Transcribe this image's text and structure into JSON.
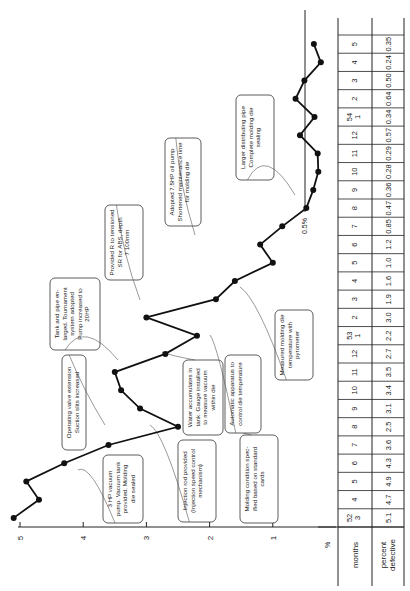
{
  "chart_data": {
    "type": "line",
    "orientation": "rotated-90-ccw",
    "title": "",
    "xlabel": "months",
    "ylabel": "%",
    "ylim": [
      0,
      5
    ],
    "y_ticks": [
      "5",
      "4",
      "3",
      "2",
      "1"
    ],
    "reference_line": {
      "value": 0.5,
      "label": "0.5%"
    },
    "table_row_labels": [
      "months",
      "percent defective"
    ],
    "categories": [
      "52/3",
      "4",
      "5",
      "6",
      "7",
      "8",
      "9",
      "10",
      "11",
      "12",
      "53/1",
      "2",
      "3",
      "4",
      "5",
      "6",
      "7",
      "8",
      "9",
      "10",
      "11",
      "12",
      "54/1",
      "2",
      "3",
      "4",
      "5"
    ],
    "month_labels": [
      {
        "year": "52",
        "month": "3"
      },
      {
        "month": "4"
      },
      {
        "month": "5"
      },
      {
        "month": "6"
      },
      {
        "month": "7"
      },
      {
        "month": "8"
      },
      {
        "month": "9"
      },
      {
        "month": "10"
      },
      {
        "month": "11"
      },
      {
        "month": "12"
      },
      {
        "year": "53",
        "month": "1"
      },
      {
        "month": "2"
      },
      {
        "month": "3"
      },
      {
        "month": "4"
      },
      {
        "month": "5"
      },
      {
        "month": "6"
      },
      {
        "month": "7"
      },
      {
        "month": "8"
      },
      {
        "month": "9"
      },
      {
        "month": "10"
      },
      {
        "month": "11"
      },
      {
        "month": "12"
      },
      {
        "year": "54",
        "month": "1"
      },
      {
        "month": "2"
      },
      {
        "month": "3"
      },
      {
        "month": "4"
      },
      {
        "month": "5"
      }
    ],
    "values": [
      5.1,
      4.7,
      4.9,
      4.3,
      3.6,
      2.5,
      3.1,
      3.4,
      3.5,
      2.7,
      2.2,
      3.0,
      1.9,
      1.6,
      1.0,
      1.2,
      0.85,
      0.47,
      0.36,
      0.28,
      0.29,
      0.57,
      0.34,
      0.64,
      0.5,
      0.24,
      0.35
    ],
    "value_labels": [
      "5.1",
      "4.7",
      "4.9",
      "4.3",
      "3.6",
      "2.5",
      "3.1",
      "3.4",
      "3.5",
      "2.7",
      "2.2",
      "3.0",
      "1.9",
      "1.6",
      "1.0",
      "1.2",
      "0.85",
      "0.47",
      "0.36",
      "0.28",
      "0.29",
      "0.57",
      "0.34",
      "0.64",
      "0.50",
      "0.24",
      "0.35"
    ],
    "annotations": [
      {
        "text": [
          "3 HP vacuum",
          "pump. Vacuum tank",
          "provided. Molding",
          "die sealed"
        ]
      },
      {
        "text": [
          "Operating valve extension",
          "Suction slits increased"
        ]
      },
      {
        "text": [
          "Injection rod provided",
          "(Injection speed control",
          "mechanism)"
        ]
      },
      {
        "text": [
          "Water accumulates in",
          "tank. Gauge installed",
          "to measure vacuum",
          "within die"
        ]
      },
      {
        "text": [
          "Tank and pipe en-",
          "larged. Tournament",
          "system adopted",
          "Pump increased to",
          "20HP"
        ]
      },
      {
        "text": [
          "Molding condition spec-",
          "ified based on standard",
          "cards"
        ]
      },
      {
        "text": [
          "Automatic apparatus to",
          "control die temperature"
        ]
      },
      {
        "text": [
          "Provided R to tensioned",
          "SR for ABS, depth",
          "7 100mm"
        ]
      },
      {
        "text": [
          "Measured molding die",
          "temperature with",
          "pyrometer"
        ]
      },
      {
        "text": [
          "Adopted 7.5HP oil pump",
          "Shortened maintenance time",
          "for molding die"
        ]
      },
      {
        "text": [
          "Larger distributing pipe",
          "Complete molding die",
          "sealing"
        ]
      }
    ]
  }
}
